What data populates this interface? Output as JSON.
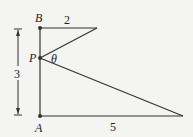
{
  "diagram": {
    "points": {
      "A": {
        "label": "A"
      },
      "B": {
        "label": "B"
      },
      "P": {
        "label": "P"
      }
    },
    "angle_label": "θ",
    "lengths": {
      "BA_total": "3",
      "top_segment": "2",
      "bottom_segment": "5"
    },
    "colors": {
      "line": "#333333",
      "background": "#f4f4f2"
    }
  }
}
